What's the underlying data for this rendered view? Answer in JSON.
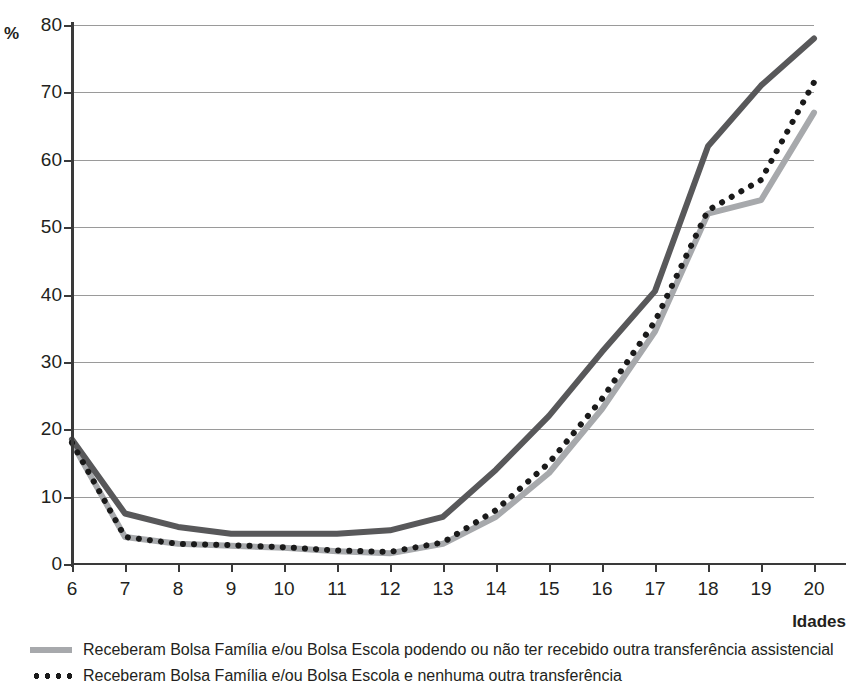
{
  "axis": {
    "y_unit_label": "%",
    "x_title": "Idades",
    "y_ticks": [
      0,
      10,
      20,
      30,
      40,
      50,
      60,
      70,
      80
    ],
    "x_ticks": [
      6,
      7,
      8,
      9,
      10,
      11,
      12,
      13,
      14,
      15,
      16,
      17,
      18,
      19,
      20
    ]
  },
  "legend": {
    "items": [
      {
        "marker": "solid-light-gray-line",
        "label": "Receberam Bolsa Família e/ou Bolsa Escola podendo ou não ter recebido outra transferência assistencial"
      },
      {
        "marker": "black-dotted-line",
        "label": "Receberam Bolsa Família e/ou Bolsa Escola e nenhuma outra transferência"
      }
    ]
  },
  "colors": {
    "dark_line": "#58585a",
    "light_line": "#a7a9ac",
    "dotted_line": "#1a1a1a",
    "gridline": "#9a9a9a",
    "axis": "#3a3a3a",
    "text": "#231f20"
  },
  "chart_data": {
    "type": "line",
    "title": "",
    "xlabel": "Idades",
    "ylabel": "%",
    "xlim": [
      6,
      20
    ],
    "ylim": [
      0,
      80
    ],
    "grid": true,
    "legend_position": "below",
    "x": [
      6,
      7,
      8,
      9,
      10,
      11,
      12,
      13,
      14,
      15,
      16,
      17,
      18,
      19,
      20
    ],
    "series": [
      {
        "name": "Linha cinza escura (série sem legenda visível)",
        "style": "solid",
        "color": "#58585a",
        "values": [
          18.5,
          7.5,
          5.5,
          4.5,
          4.5,
          4.5,
          5.0,
          7.0,
          14.0,
          22.0,
          31.5,
          40.5,
          62.0,
          71.0,
          78.0
        ]
      },
      {
        "name": "Receberam Bolsa Família e/ou Bolsa Escola e nenhuma outra transferência",
        "style": "dotted",
        "color": "#1a1a1a",
        "values": [
          18.0,
          4.0,
          3.0,
          2.8,
          2.5,
          2.0,
          1.8,
          3.2,
          8.0,
          15.0,
          24.5,
          36.0,
          52.5,
          57.0,
          71.5
        ]
      },
      {
        "name": "Receberam Bolsa Família e/ou Bolsa Escola podendo ou não ter recebido outra transferência assistencial",
        "style": "solid",
        "color": "#a7a9ac",
        "values": [
          18.0,
          4.0,
          3.0,
          2.7,
          2.4,
          1.9,
          1.6,
          3.0,
          7.0,
          13.5,
          23.0,
          34.5,
          52.0,
          54.0,
          67.0
        ]
      }
    ]
  }
}
